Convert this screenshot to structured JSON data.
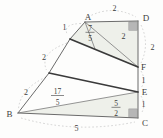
{
  "diagram": {
    "points": {
      "a": "A",
      "b": "B",
      "c": "C",
      "d": "D",
      "e": "E",
      "f": "F"
    },
    "measures": {
      "top_ad": "2",
      "right_df": "2",
      "right_fe": "1",
      "right_ec": "1",
      "bottom_bc": "5",
      "left_upper_1": "1",
      "left_mid_2": "2",
      "left_lower_2": "2",
      "inner_af": "2"
    },
    "fractions": {
      "near_a": {
        "num": "7",
        "den": "5"
      },
      "mid_left": {
        "num": "17",
        "den": "5"
      },
      "near_c": {
        "num": "5",
        "den": "2"
      }
    },
    "colors": {
      "tint": "#eef0ea",
      "thick_line": "#3a3a3a",
      "edge_line": "#6b6b6b",
      "dash_line": "#c6c6c6",
      "marker_square": "#b6b6b6",
      "text": "#3d3d3d"
    }
  }
}
